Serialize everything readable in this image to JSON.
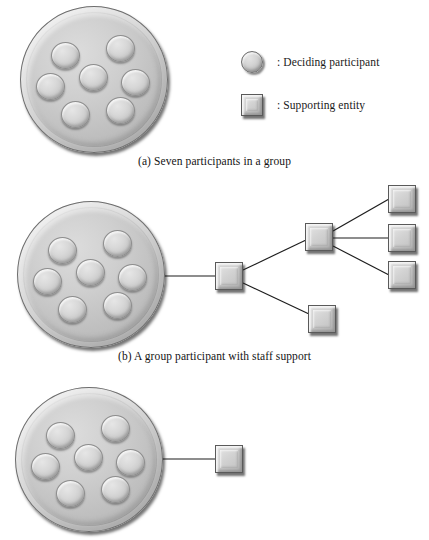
{
  "figure": {
    "width": 429,
    "height": 540,
    "background": "#ffffff"
  },
  "legend": {
    "items": [
      {
        "icon": "deciding-participant-circle",
        "separator": ":",
        "label": ": Deciding participant",
        "shape": "circle"
      },
      {
        "icon": "supporting-entity-square",
        "separator": ":",
        "label": ": Supporting entity",
        "shape": "square"
      }
    ]
  },
  "panels": [
    {
      "id": "a",
      "caption": "(a) Seven participants in a group",
      "participant_count": 7,
      "entity_count": 0
    },
    {
      "id": "b",
      "caption": "(b) A group participant with staff support",
      "participant_count": 7,
      "entity_count": 6
    },
    {
      "id": "c",
      "caption": "",
      "participant_count": 7,
      "entity_count": 1
    }
  ],
  "colors": {
    "disc_light": "#e2e2e2",
    "disc_mid": "#c3c3c3",
    "disc_dark": "#9d9d9d",
    "entity_fill": "#cfcfcf",
    "entity_border": "#5a5a5a",
    "line": "#1d1d1d",
    "text": "#141414",
    "background": "#ffffff"
  },
  "structure": {
    "panel_b_tree": {
      "root": "group-participant",
      "level1": [
        "staff-lead"
      ],
      "level2": [
        "staff-hub",
        "staff-member-lower"
      ],
      "level3": [
        "staff-member-top",
        "staff-member-middle",
        "staff-member-bottom"
      ]
    },
    "panel_c_tree": {
      "root": "group-participant",
      "level1": [
        "single-support-entity"
      ]
    }
  }
}
